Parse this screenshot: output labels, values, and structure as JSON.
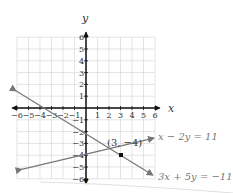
{
  "chart_data": {
    "type": "line",
    "title": "",
    "xlabel": "x",
    "ylabel": "y",
    "xlim": [
      -6,
      6
    ],
    "ylim": [
      -6,
      6
    ],
    "grid": true,
    "x_ticks": [
      "−6",
      "−5",
      "−4",
      "−3",
      "−2",
      "−1",
      "1",
      "2",
      "3",
      "4",
      "5",
      "6"
    ],
    "y_ticks": [
      "6",
      "5",
      "4",
      "3",
      "2",
      "1",
      "−1",
      "−2",
      "−3",
      "−4",
      "−5",
      "−6"
    ],
    "series": [
      {
        "name": "x − 2y = 11",
        "equation": "x - 2y = 11",
        "points": [
          [
            -5.5,
            -8.25
          ],
          [
            6,
            -2.5
          ]
        ],
        "color": "#777777"
      },
      {
        "name": "3x + 5y = −11",
        "equation": "3x + 5y = -11",
        "points": [
          [
            -6,
            1.4
          ],
          [
            6,
            -5.8
          ]
        ],
        "color": "#777777"
      }
    ],
    "annotations": [
      {
        "text": "(3, −4)",
        "x": 3,
        "y": -4,
        "type": "intersection-point"
      }
    ]
  },
  "labels": {
    "x_axis": "x",
    "y_axis": "y",
    "eq1": "x − 2y = 11",
    "eq2": "3x + 5y = −11",
    "point": "(3, −4)"
  }
}
